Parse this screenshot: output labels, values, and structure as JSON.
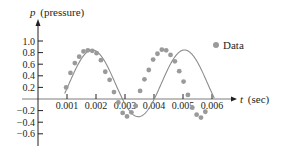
{
  "chart_data": {
    "type": "scatter",
    "title": "",
    "xlabel": "t (sec)",
    "ylabel": "p (pressure)",
    "xlabel_var": "t",
    "xlabel_unit": "(sec)",
    "ylabel_var": "p",
    "ylabel_unit": "(pressure)",
    "x_ticks": [
      "0.001",
      "0.002",
      "0.003",
      "0.004",
      "0.005",
      "0.006"
    ],
    "x_tick_values": [
      0.001,
      0.002,
      0.003,
      0.004,
      0.005,
      0.006
    ],
    "y_ticks": [
      "1.0",
      "0.8",
      "0.6",
      "0.4",
      "0.2",
      "−0.2",
      "−0.4",
      "−0.6"
    ],
    "y_tick_values": [
      1.0,
      0.8,
      0.6,
      0.4,
      0.2,
      -0.2,
      -0.4,
      -0.6
    ],
    "xlim": [
      0,
      0.0065
    ],
    "ylim": [
      -0.75,
      1.25
    ],
    "grid": false,
    "legend": {
      "position": "upper right",
      "entries": [
        "Data"
      ]
    },
    "series": [
      {
        "name": "Data",
        "kind": "points",
        "color": "#9a9a9a",
        "x": [
          0.00097,
          0.00112,
          0.00127,
          0.00142,
          0.00157,
          0.00172,
          0.00187,
          0.00202,
          0.00217,
          0.00232,
          0.00247,
          0.00262,
          0.00277,
          0.00292,
          0.00307,
          0.00322,
          0.00337,
          0.00352,
          0.00367,
          0.00382,
          0.00397,
          0.00412,
          0.00427,
          0.00442,
          0.00457,
          0.00472,
          0.00487,
          0.00502,
          0.00517,
          0.00532,
          0.00547,
          0.00562,
          0.00577
        ],
        "y": [
          0.2,
          0.45,
          0.62,
          0.73,
          0.82,
          0.84,
          0.83,
          0.79,
          0.67,
          0.47,
          0.33,
          0.12,
          -0.06,
          -0.24,
          -0.3,
          -0.23,
          -0.12,
          0.14,
          0.34,
          0.5,
          0.68,
          0.78,
          0.85,
          0.84,
          0.76,
          0.65,
          0.48,
          0.3,
          0.07,
          -0.15,
          -0.27,
          -0.32,
          -0.22
        ]
      },
      {
        "name": "Fitted curve",
        "kind": "line",
        "color": "#8c8c8c",
        "model": "p = 0.28 + 0.57 sin(2π(t − 0.00099)/0.00318 + 0.52)",
        "t_start": 0.00092,
        "t_end": 0.0061
      }
    ]
  }
}
